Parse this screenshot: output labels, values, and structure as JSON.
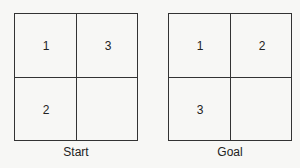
{
  "puzzles": [
    {
      "caption": "Start",
      "cells": [
        "1",
        "3",
        "2",
        ""
      ]
    },
    {
      "caption": "Goal",
      "cells": [
        "1",
        "2",
        "3",
        ""
      ]
    }
  ]
}
